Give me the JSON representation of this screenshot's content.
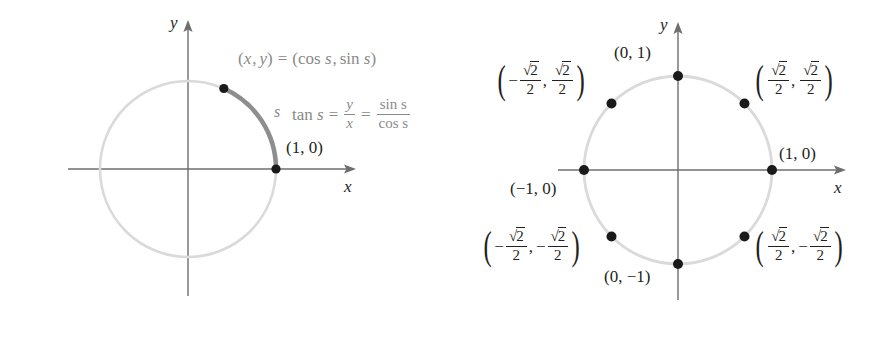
{
  "figure": {
    "colors": {
      "axis": "#6e6e70",
      "circle": "#d9d9d9",
      "arc_highlight": "#8c8c8c",
      "point": "#1a1a1a",
      "formula_text": "#8a8a8a",
      "label_text": "#231f20"
    }
  },
  "left_panel": {
    "name": "unit-circle-parametrization",
    "axis_labels": {
      "x": "x",
      "y": "y"
    },
    "arc_label": "s",
    "point_label": "(1, 0)",
    "parametric_label": {
      "lhs_x": "x",
      "lhs_y": "y",
      "text": "(x, y) = (cos s, sin s)",
      "open": "(",
      "close": ")",
      "cos": "cos",
      "sin": "sin",
      "var": "s",
      "equals": "=",
      "comma": ","
    },
    "tangent_identity": {
      "text": "tan s = y/x = sin s / cos s",
      "tan": "tan",
      "var": "s",
      "equals": "=",
      "frac1_num": "y",
      "frac1_den": "x",
      "frac2_num": "sin s",
      "frac2_den": "cos s"
    },
    "geometry": {
      "center_x": 188,
      "center_y": 169,
      "radius": 88,
      "arc_start_deg": 0,
      "arc_end_deg": 66,
      "points": [
        {
          "label": "(1, 0)",
          "deg": 0
        },
        {
          "label": "(cos s, sin s)",
          "deg": 66
        }
      ]
    }
  },
  "right_panel": {
    "name": "unit-circle-special-points",
    "axis_labels": {
      "x": "x",
      "y": "y"
    },
    "geometry": {
      "center_x": 678,
      "center_y": 170,
      "radius": 94
    },
    "points": [
      {
        "name": "point-0-1",
        "deg": 90,
        "label": "(0, 1)",
        "kind": "plain"
      },
      {
        "name": "point-1-0",
        "deg": 0,
        "label": "(1, 0)",
        "kind": "plain"
      },
      {
        "name": "point-neg1-0",
        "deg": 180,
        "label": "(−1, 0)",
        "kind": "plain"
      },
      {
        "name": "point-0-neg1",
        "deg": 270,
        "label": "(0, −1)",
        "kind": "plain"
      },
      {
        "name": "point-q1",
        "deg": 45,
        "kind": "radical",
        "x_sign": "",
        "y_sign": "",
        "num": "2",
        "den": "2"
      },
      {
        "name": "point-q2",
        "deg": 135,
        "kind": "radical",
        "x_sign": "−",
        "y_sign": "",
        "num": "2",
        "den": "2"
      },
      {
        "name": "point-q3",
        "deg": 225,
        "kind": "radical",
        "x_sign": "−",
        "y_sign": "−",
        "num": "2",
        "den": "2"
      },
      {
        "name": "point-q4",
        "deg": 315,
        "kind": "radical",
        "x_sign": "",
        "y_sign": "−",
        "num": "2",
        "den": "2"
      }
    ],
    "radical_symbol": "√",
    "labels": {
      "top": "(0, 1)",
      "right": "(1, 0)",
      "left": "(−1, 0)",
      "bottom": "(0, −1)"
    }
  }
}
